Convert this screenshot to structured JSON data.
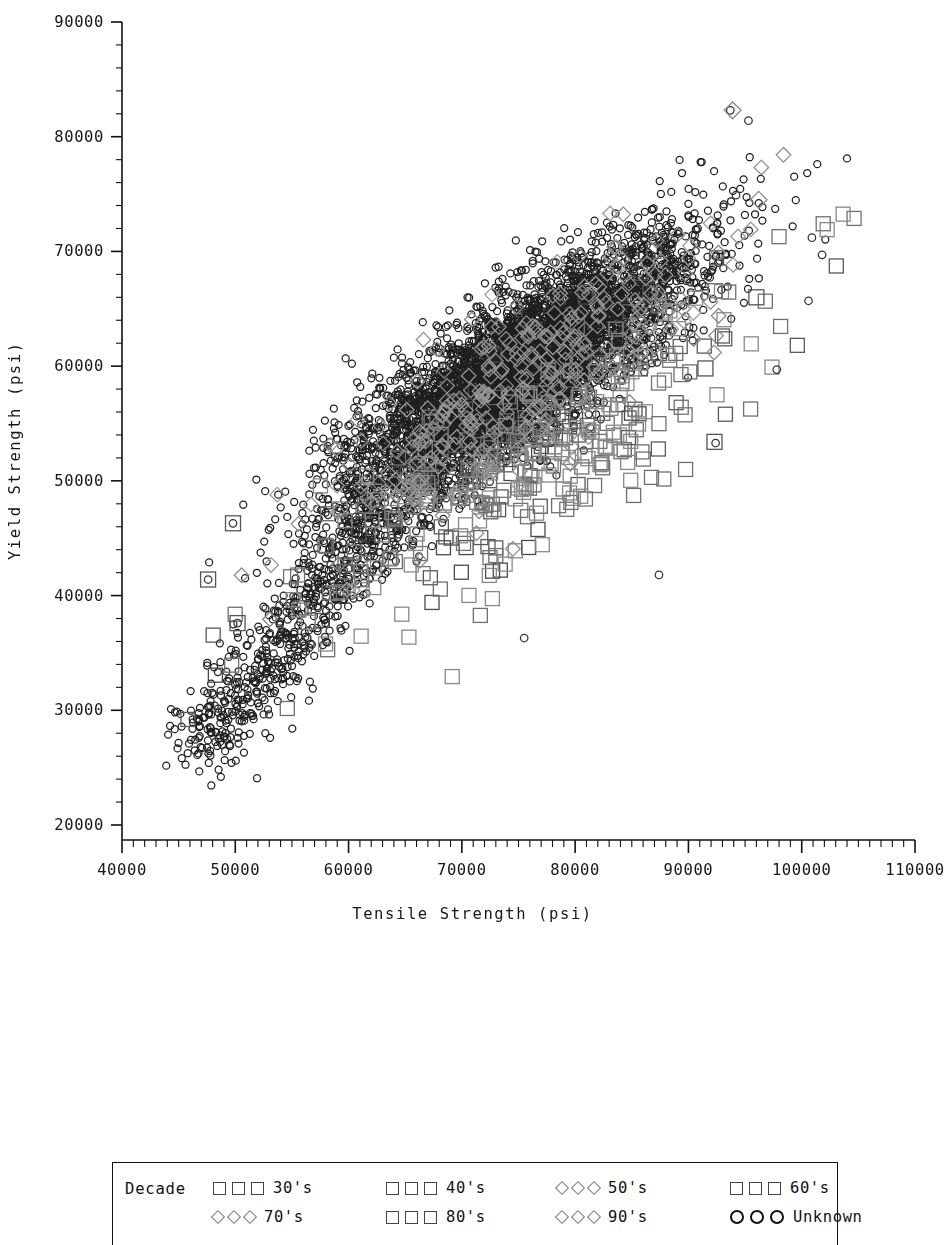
{
  "chart_data": {
    "type": "scatter",
    "title": "",
    "xlabel": "Tensile Strength (psi)",
    "ylabel": "Yield Strength (psi)",
    "xlim": [
      40000,
      110000
    ],
    "ylim": [
      20000,
      90000
    ],
    "xticks": [
      40000,
      50000,
      60000,
      70000,
      80000,
      90000,
      100000,
      110000
    ],
    "yticks": [
      20000,
      30000,
      40000,
      50000,
      60000,
      70000,
      80000,
      90000
    ],
    "xtick_labels": [
      "40000",
      "50000",
      "60000",
      "70000",
      "80000",
      "90000",
      "100000",
      "110000"
    ],
    "ytick_labels": [
      "20000",
      "30000",
      "40000",
      "50000",
      "60000",
      "70000",
      "80000",
      "90000"
    ],
    "x_minor_interval": 1000,
    "y_minor_interval": 2000,
    "grid": false,
    "legend_position": "bottom",
    "legend_title": "Decade",
    "series": [
      {
        "name": "30's",
        "marker": "square",
        "color": "#4a4a4a",
        "size": 14,
        "n": 40
      },
      {
        "name": "40's",
        "marker": "square",
        "color": "#5a5a5a",
        "size": 14,
        "n": 70
      },
      {
        "name": "50's",
        "marker": "diamond",
        "color": "#8a8a8a",
        "size": 13,
        "n": 90
      },
      {
        "name": "60's",
        "marker": "square",
        "color": "#707070",
        "size": 14,
        "n": 110
      },
      {
        "name": "70's",
        "marker": "diamond",
        "color": "#909090",
        "size": 13,
        "n": 120
      },
      {
        "name": "80's",
        "marker": "square",
        "color": "#888888",
        "size": 14,
        "n": 140
      },
      {
        "name": "90's",
        "marker": "diamond",
        "color": "#9a9a9a",
        "size": 13,
        "n": 120
      },
      {
        "name": "Unknown",
        "marker": "circle",
        "color": "#1f1f1f",
        "size": 7,
        "n": 5600
      }
    ],
    "cluster_center": [
      75000,
      60000
    ],
    "correlation": 0.82
  },
  "axes": {
    "x_axis_name": "tensile-strength-axis",
    "y_axis_name": "yield-strength-axis"
  },
  "legend": {
    "title": "Decade",
    "entries": [
      {
        "label": "30's",
        "marker": "square"
      },
      {
        "label": "40's",
        "marker": "square"
      },
      {
        "label": "50's",
        "marker": "diamond"
      },
      {
        "label": "60's",
        "marker": "square"
      },
      {
        "label": "70's",
        "marker": "diamond"
      },
      {
        "label": "80's",
        "marker": "square"
      },
      {
        "label": "90's",
        "marker": "diamond"
      },
      {
        "label": "Unknown",
        "marker": "circle"
      }
    ]
  }
}
